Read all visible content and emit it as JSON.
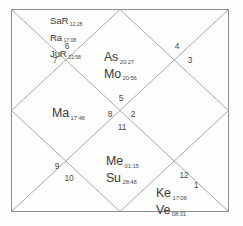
{
  "chart": {
    "style": "north-indian-vedic-kundali",
    "title": "",
    "border_color": "#8a8a8a",
    "line_color": "#9a9a9a",
    "text_color": "#3a3a3c",
    "background": "#fefefe",
    "houses": [
      {
        "number": "1",
        "x": 196,
        "y": 185
      },
      {
        "number": "2",
        "x": 133,
        "y": 114
      },
      {
        "number": "3",
        "x": 190,
        "y": 60
      },
      {
        "number": "4",
        "x": 177,
        "y": 46
      },
      {
        "number": "5",
        "x": 121,
        "y": 98
      },
      {
        "number": "6",
        "x": 67,
        "y": 46
      },
      {
        "number": "7",
        "x": 55,
        "y": 60
      },
      {
        "number": "8",
        "x": 110,
        "y": 114
      },
      {
        "number": "9",
        "x": 57,
        "y": 166
      },
      {
        "number": "10",
        "x": 69,
        "y": 178
      },
      {
        "number": "11",
        "x": 122,
        "y": 127
      },
      {
        "number": "12",
        "x": 184,
        "y": 175
      }
    ],
    "planet_groups": [
      {
        "name": "house-6-planets",
        "x": 50,
        "y": 11,
        "size": "small",
        "align": "left",
        "planets": [
          {
            "abbr": "SaR",
            "degree": "12:28"
          },
          {
            "abbr": "Ra",
            "degree": "17:08"
          },
          {
            "abbr": "JuR",
            "degree": "23:58"
          }
        ]
      },
      {
        "name": "house-4-planets",
        "x": 104,
        "y": 48,
        "size": "large",
        "align": "left",
        "planets": [
          {
            "abbr": "As",
            "degree": "20:27"
          },
          {
            "abbr": "Mo",
            "degree": "20:56"
          }
        ]
      },
      {
        "name": "house-7-planets",
        "x": 52,
        "y": 104,
        "size": "large",
        "align": "left",
        "planets": [
          {
            "abbr": "Ma",
            "degree": "17:48"
          }
        ]
      },
      {
        "name": "house-10-planets",
        "x": 106,
        "y": 152,
        "size": "large",
        "align": "left",
        "planets": [
          {
            "abbr": "Me",
            "degree": "01:15"
          },
          {
            "abbr": "Su",
            "degree": "28:48"
          }
        ]
      },
      {
        "name": "house-12-planets",
        "x": 156,
        "y": 184,
        "size": "large",
        "align": "left",
        "planets": [
          {
            "abbr": "Ke",
            "degree": "17:08"
          },
          {
            "abbr": "Ve",
            "degree": "08:31"
          }
        ]
      }
    ]
  }
}
